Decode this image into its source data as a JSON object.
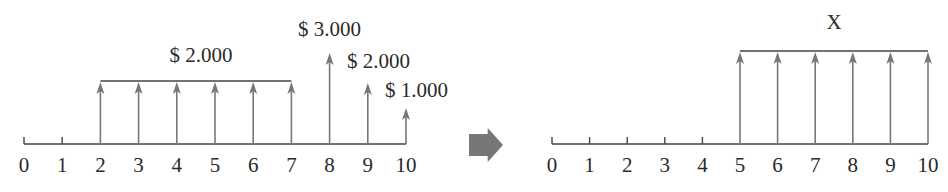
{
  "diagrams": [
    {
      "name": "original-cash-flow",
      "axis": {
        "x0": 24,
        "step": 38.2,
        "y": 144,
        "periods": [
          0,
          1,
          2,
          3,
          4,
          5,
          6,
          7,
          8,
          9,
          10
        ]
      },
      "ticks": [
        0,
        1
      ],
      "arrows": [
        {
          "period": 2,
          "top": 82
        },
        {
          "period": 3,
          "top": 82
        },
        {
          "period": 4,
          "top": 82
        },
        {
          "period": 5,
          "top": 82
        },
        {
          "period": 6,
          "top": 82
        },
        {
          "period": 7,
          "top": 82
        },
        {
          "period": 8,
          "top": 53
        },
        {
          "period": 9,
          "top": 83
        },
        {
          "period": 10,
          "top": 108
        }
      ],
      "brackets": [
        {
          "from": 2,
          "to": 7,
          "y": 81
        }
      ],
      "labels": [
        {
          "text": "$ 2.000",
          "x": 201,
          "y": 62,
          "anchor": "middle"
        },
        {
          "text": "$ 3.000",
          "x": 298,
          "y": 36,
          "anchor": "start"
        },
        {
          "text": "$ 2.000",
          "x": 347,
          "y": 68,
          "anchor": "start"
        },
        {
          "text": "$ 1.000",
          "x": 385,
          "y": 97,
          "anchor": "start"
        }
      ]
    },
    {
      "name": "equivalent-cash-flow",
      "axis": {
        "x0": 552,
        "step": 37.6,
        "y": 144,
        "periods": [
          0,
          1,
          2,
          3,
          4,
          5,
          6,
          7,
          8,
          9,
          10
        ]
      },
      "ticks": [
        0,
        1,
        2,
        3,
        4
      ],
      "arrows": [
        {
          "period": 5,
          "top": 52
        },
        {
          "period": 6,
          "top": 52
        },
        {
          "period": 7,
          "top": 52
        },
        {
          "period": 8,
          "top": 52
        },
        {
          "period": 9,
          "top": 52
        },
        {
          "period": 10,
          "top": 52
        }
      ],
      "brackets": [
        {
          "from": 5,
          "to": 10,
          "y": 51
        }
      ],
      "labels": [
        {
          "text": "X",
          "x": 834,
          "y": 29,
          "anchor": "middle"
        }
      ]
    }
  ],
  "transform_arrow": {
    "x": 469,
    "y": 128,
    "w": 34,
    "h": 34,
    "color": "#777777"
  },
  "colors": {
    "axis": "#444444",
    "arrow": "#777777",
    "bracket": "#444444",
    "text": "#2a2a2a"
  }
}
